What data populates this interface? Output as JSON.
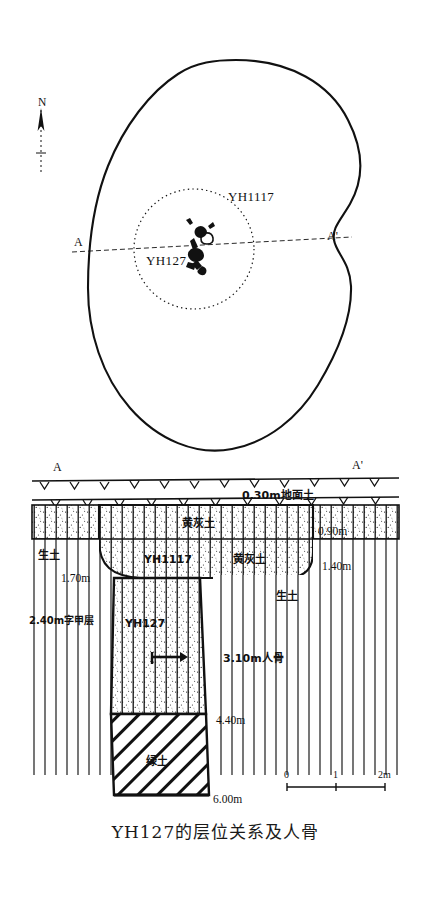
{
  "figure": {
    "caption": "YH127的层位关系及人骨",
    "domain": "archaeological-section-drawing"
  },
  "plan_view": {
    "north_arrow_label": "N",
    "pit_outer_label": "YH1117",
    "pit_inner_label": "YH127",
    "section_line_left_label": "A",
    "section_line_right_label": "A'",
    "feature_note": "human-skeleton-symbol"
  },
  "section_view": {
    "left_marker": "A",
    "right_marker": "A'",
    "layers": [
      {
        "name": "地面土",
        "depth_label": "0.30m地面土",
        "pattern": "surface"
      },
      {
        "name": "黄灰土",
        "depth_label": "0.90m",
        "pattern": "stipple-vertical"
      },
      {
        "name": "黄灰土",
        "depth_label": "1.40m",
        "pattern": "stipple-vertical"
      },
      {
        "name": "生土",
        "depth_label": "1.70m",
        "pattern": "vertical-hatch"
      },
      {
        "name": "生土",
        "depth_label": "",
        "pattern": "vertical-hatch"
      },
      {
        "name": "字甲层",
        "depth_label": "2.40m字甲层",
        "pattern": "fill"
      },
      {
        "name": "YH127",
        "depth_label": "3.10m人骨",
        "pattern": "stipple-vertical"
      },
      {
        "name": "绿土",
        "depth_label": "4.40m",
        "pattern": "diagonal-hatch"
      },
      {
        "name": "",
        "depth_label": "6.00m",
        "pattern": "bottom"
      }
    ],
    "labels": {
      "ground_soil": "0.30m地面土",
      "yellow_grey_soil_top": "黄灰土",
      "depth_090": "0.90m",
      "virgin_soil_left": "生土",
      "pit_outer": "YH1117",
      "yellow_grey_soil_right": "黄灰土",
      "depth_140": "1.40m",
      "depth_170": "1.70m",
      "oracle_bone_layer": "2.40m字甲层",
      "pit_inner": "YH127",
      "virgin_soil_right": "生土",
      "human_bone": "3.10m人骨",
      "depth_440": "4.40m",
      "green_soil": "绿土",
      "depth_600": "6.00m"
    }
  },
  "scale_bar": {
    "ticks": [
      "0",
      "1",
      "2m"
    ],
    "unit": "m",
    "length_m": 2
  },
  "colors": {
    "ink": "#111111",
    "paper": "#ffffff"
  }
}
